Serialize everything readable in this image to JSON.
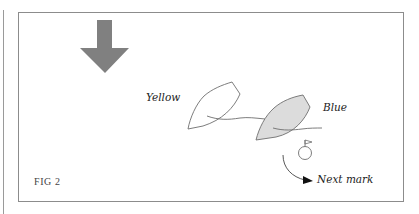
{
  "figure": {
    "caption": "FIG 2",
    "labels": {
      "yellow_boat": "Yellow",
      "blue_boat": "Blue",
      "next_mark": "Next mark"
    },
    "icons": {
      "wind_arrow": "down-arrow-icon",
      "mark": "mark-buoy-flag-icon",
      "rounding_arrow": "curved-arrow-icon"
    },
    "colors": {
      "wind_arrow": "#808080",
      "blue_boat_fill": "#dcdcdc",
      "outline": "#6e6e6e",
      "frame": "#8c8c8c",
      "text": "#222222"
    }
  }
}
